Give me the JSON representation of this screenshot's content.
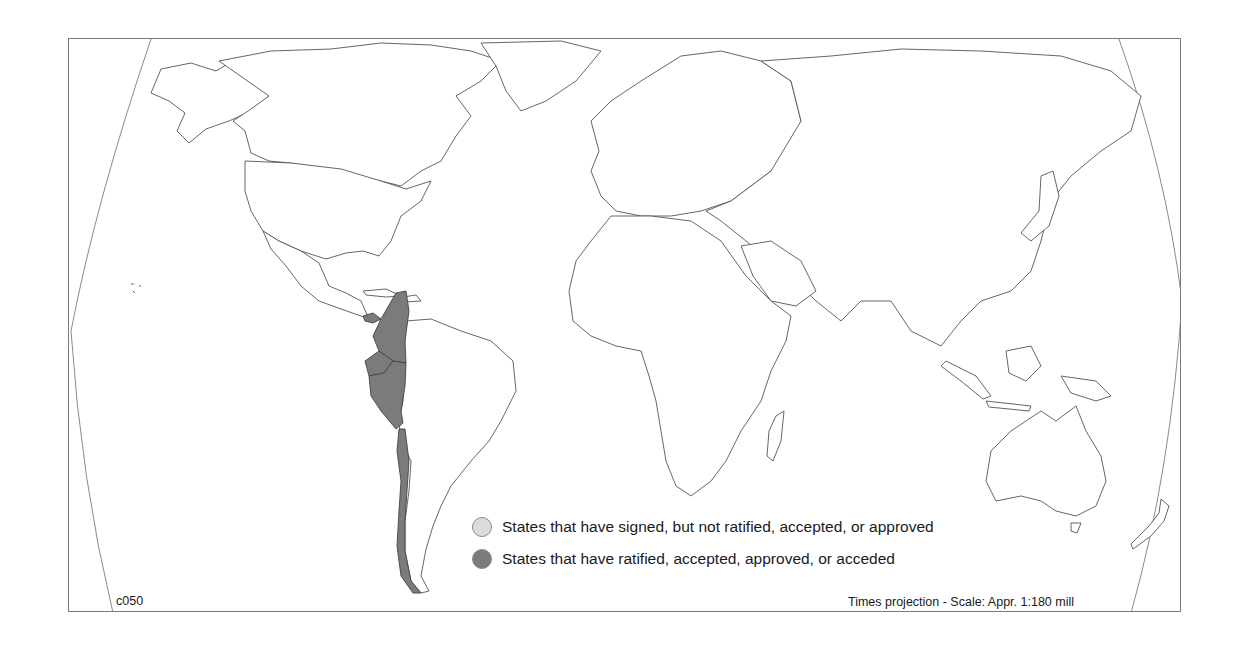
{
  "map": {
    "id_label": "c050",
    "projection_label": "Times projection - Scale: Appr. 1:180 mill",
    "colors": {
      "signed": "#dcdcdc",
      "ratified": "#7b7b7b",
      "outline": "#555555",
      "frame": "#7a7a7a"
    },
    "highlighted_states": [
      {
        "name": "Panama",
        "status": "ratified"
      },
      {
        "name": "Colombia",
        "status": "ratified"
      },
      {
        "name": "Ecuador",
        "status": "ratified"
      },
      {
        "name": "Peru",
        "status": "ratified"
      },
      {
        "name": "Chile",
        "status": "ratified"
      }
    ]
  },
  "legend": {
    "items": [
      {
        "key": "signed",
        "label": "States that have signed, but not ratified, accepted, or approved",
        "color": "#dcdcdc"
      },
      {
        "key": "ratified",
        "label": "States that have ratified, accepted, approved, or acceded",
        "color": "#7b7b7b"
      }
    ]
  }
}
